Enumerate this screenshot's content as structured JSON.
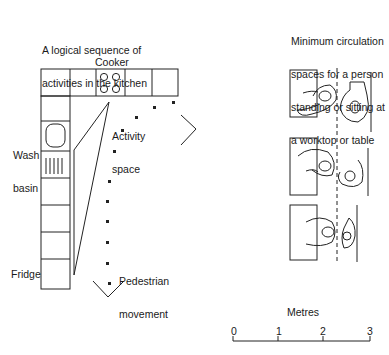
{
  "left_panel": {
    "title_line1": "A logical sequence of",
    "title_line2": "activities in the kitchen",
    "labels": {
      "cooker": "Cooker",
      "wash_basin_1": "Wash",
      "wash_basin_2": "basin",
      "activity_1": "Activity",
      "activity_2": "space",
      "fridge": "Fridge",
      "pedestrian_1": "Pedestrian",
      "pedestrian_2": "movement"
    }
  },
  "right_panel": {
    "title_lines": [
      "Minimum circulation",
      "spaces for a person",
      "standing or sitting at",
      "a worktop or table"
    ]
  },
  "scale_bar": {
    "label": "Metres",
    "ticks": [
      "0",
      "1",
      "2",
      "3"
    ]
  }
}
